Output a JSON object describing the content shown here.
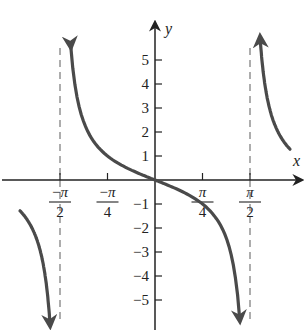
{
  "chart_data": {
    "type": "line",
    "title": "",
    "function": "y = -tan(x)",
    "xlabel": "x",
    "ylabel": "y",
    "xlim": [
      -2.0,
      2.3
    ],
    "ylim": [
      -6.2,
      6.2
    ],
    "grid": false,
    "legend": null,
    "x_ticks": [
      {
        "value": -1.5708,
        "label_num": "−π",
        "label_den": "2"
      },
      {
        "value": -0.7854,
        "label_num": "−π",
        "label_den": "4"
      },
      {
        "value": 0.7854,
        "label_num": "π",
        "label_den": "4"
      },
      {
        "value": 1.5708,
        "label_num": "π",
        "label_den": "2"
      }
    ],
    "y_ticks": [
      5,
      4,
      3,
      2,
      1,
      -1,
      -2,
      -3,
      -4,
      -5
    ],
    "y_tick_labels": [
      "5",
      "4",
      "3",
      "2",
      "1",
      "−1",
      "−2",
      "−3",
      "−4",
      "−5"
    ],
    "asymptotes": [
      -1.5708,
      1.5708
    ],
    "series": [
      {
        "name": "left branch (x < -π/2)",
        "x": [
          -1.95,
          -1.9,
          -1.85,
          -1.8,
          -1.75,
          -1.7,
          -1.66
        ],
        "values": [
          -2.6,
          -2.9,
          -3.3,
          -4.0,
          -5.0,
          -6.3,
          -7.8
        ],
        "arrow": "down"
      },
      {
        "name": "central branch (-π/2 < x < π/2)",
        "x": [
          -1.4,
          -1.2,
          -1.0,
          -0.7854,
          -0.5,
          -0.25,
          0,
          0.25,
          0.5,
          0.7854,
          1.0,
          1.2,
          1.4
        ],
        "values": [
          5.8,
          2.57,
          1.56,
          1.0,
          0.55,
          0.26,
          0,
          -0.26,
          -0.55,
          -1.0,
          -1.56,
          -2.57,
          -5.8
        ],
        "arrow": "both"
      },
      {
        "name": "right branch (x > π/2)",
        "x": [
          1.66,
          1.7,
          1.75,
          1.8,
          1.85,
          1.9,
          1.95
        ],
        "values": [
          7.8,
          6.3,
          5.0,
          4.0,
          3.3,
          2.9,
          2.6
        ],
        "arrow": "up"
      }
    ]
  },
  "labels": {
    "x_axis": "x",
    "y_axis": "y"
  },
  "colors": {
    "curve": "#4a4a4a",
    "axis": "#222222",
    "asymptote": "#777777"
  }
}
